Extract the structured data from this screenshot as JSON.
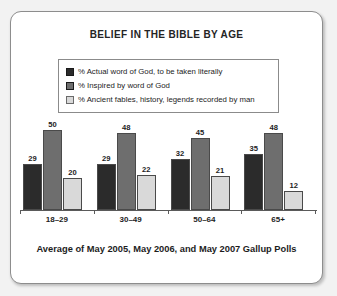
{
  "chart_data": {
    "type": "bar",
    "title": "BELIEF IN THE BIBLE BY AGE",
    "footer": "Average of May 2005, May 2006, and May 2007 Gallup Polls",
    "xlabel": "",
    "ylabel": "",
    "ylim": [
      0,
      55
    ],
    "grid": false,
    "legend_position": "top-center",
    "categories": [
      "18–29",
      "30–49",
      "50–64",
      "65+"
    ],
    "series": [
      {
        "name": "% Actual word of God, to be taken literally",
        "color": "#2b2b2b",
        "values": [
          29,
          29,
          32,
          35
        ]
      },
      {
        "name": "% Inspired by word of God",
        "color": "#6e6e6e",
        "values": [
          50,
          48,
          45,
          48
        ]
      },
      {
        "name": "% Ancient fables, history, legends recorded by man",
        "color": "#d9d9d9",
        "values": [
          20,
          22,
          21,
          12
        ]
      }
    ]
  }
}
